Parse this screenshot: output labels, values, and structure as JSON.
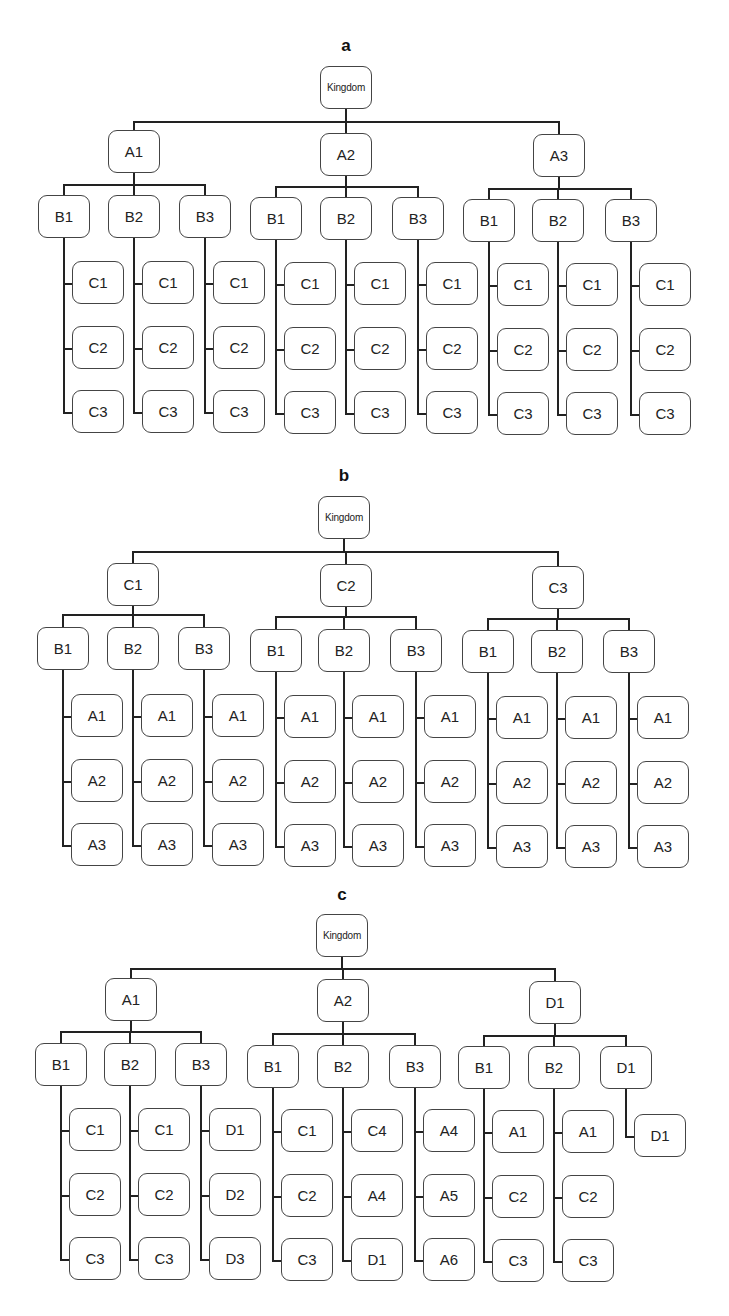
{
  "figure": {
    "panels": [
      {
        "id": "a",
        "title": "a",
        "root": "Kingdom",
        "groups": [
          {
            "label": "A1",
            "children": [
              {
                "label": "B1",
                "leaves": [
                  "C1",
                  "C2",
                  "C3"
                ]
              },
              {
                "label": "B2",
                "leaves": [
                  "C1",
                  "C2",
                  "C3"
                ]
              },
              {
                "label": "B3",
                "leaves": [
                  "C1",
                  "C2",
                  "C3"
                ]
              }
            ]
          },
          {
            "label": "A2",
            "children": [
              {
                "label": "B1",
                "leaves": [
                  "C1",
                  "C2",
                  "C3"
                ]
              },
              {
                "label": "B2",
                "leaves": [
                  "C1",
                  "C2",
                  "C3"
                ]
              },
              {
                "label": "B3",
                "leaves": [
                  "C1",
                  "C2",
                  "C3"
                ]
              }
            ]
          },
          {
            "label": "A3",
            "children": [
              {
                "label": "B1",
                "leaves": [
                  "C1",
                  "C2",
                  "C3"
                ]
              },
              {
                "label": "B2",
                "leaves": [
                  "C1",
                  "C2",
                  "C3"
                ]
              },
              {
                "label": "B3",
                "leaves": [
                  "C1",
                  "C2",
                  "C3"
                ]
              }
            ]
          }
        ]
      },
      {
        "id": "b",
        "title": "b",
        "root": "Kingdom",
        "groups": [
          {
            "label": "C1",
            "children": [
              {
                "label": "B1",
                "leaves": [
                  "A1",
                  "A2",
                  "A3"
                ]
              },
              {
                "label": "B2",
                "leaves": [
                  "A1",
                  "A2",
                  "A3"
                ]
              },
              {
                "label": "B3",
                "leaves": [
                  "A1",
                  "A2",
                  "A3"
                ]
              }
            ]
          },
          {
            "label": "C2",
            "children": [
              {
                "label": "B1",
                "leaves": [
                  "A1",
                  "A2",
                  "A3"
                ]
              },
              {
                "label": "B2",
                "leaves": [
                  "A1",
                  "A2",
                  "A3"
                ]
              },
              {
                "label": "B3",
                "leaves": [
                  "A1",
                  "A2",
                  "A3"
                ]
              }
            ]
          },
          {
            "label": "C3",
            "children": [
              {
                "label": "B1",
                "leaves": [
                  "A1",
                  "A2",
                  "A3"
                ]
              },
              {
                "label": "B2",
                "leaves": [
                  "A1",
                  "A2",
                  "A3"
                ]
              },
              {
                "label": "B3",
                "leaves": [
                  "A1",
                  "A2",
                  "A3"
                ]
              }
            ]
          }
        ]
      },
      {
        "id": "c",
        "title": "c",
        "root": "Kingdom",
        "groups": [
          {
            "label": "A1",
            "children": [
              {
                "label": "B1",
                "leaves": [
                  "C1",
                  "C2",
                  "C3"
                ]
              },
              {
                "label": "B2",
                "leaves": [
                  "C1",
                  "C2",
                  "C3"
                ]
              },
              {
                "label": "B3",
                "leaves": [
                  "D1",
                  "D2",
                  "D3"
                ]
              }
            ]
          },
          {
            "label": "A2",
            "children": [
              {
                "label": "B1",
                "leaves": [
                  "C1",
                  "C2",
                  "C3"
                ]
              },
              {
                "label": "B2",
                "leaves": [
                  "C4",
                  "A4",
                  "D1"
                ]
              },
              {
                "label": "B3",
                "leaves": [
                  "A4",
                  "A5",
                  "A6"
                ]
              }
            ]
          },
          {
            "label": "D1",
            "children": [
              {
                "label": "B1",
                "leaves": [
                  "A1",
                  "C2",
                  "C3"
                ]
              },
              {
                "label": "B2",
                "leaves": [
                  "A1",
                  "C2",
                  "C3"
                ]
              },
              {
                "label": "D1",
                "leaves": [
                  "D1"
                ]
              }
            ]
          }
        ]
      }
    ]
  }
}
